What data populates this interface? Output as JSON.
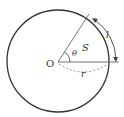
{
  "diagram": {
    "type": "circle-sector",
    "labels": {
      "center": "O",
      "angle": "θ",
      "area": "S",
      "arc_length": "l",
      "radius": "r"
    },
    "colors": {
      "stroke": "#333333",
      "radius_line": "#555555",
      "dashed": "#777777",
      "background": "#ffffff"
    }
  }
}
